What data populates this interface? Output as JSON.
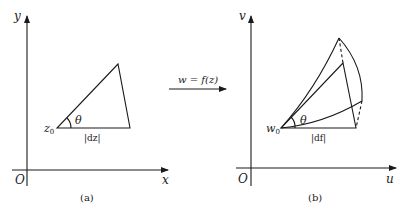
{
  "panel_a": {
    "y_axis_label": "y",
    "x_axis_label": "x",
    "origin_label": "O",
    "point_label": "z",
    "point_subscript": "0",
    "angle_label": "θ",
    "segment_label": "|dz|",
    "caption": "(a)"
  },
  "mapping": {
    "label": "w = f(z)"
  },
  "panel_b": {
    "y_axis_label": "v",
    "x_axis_label": "u",
    "origin_label": "O",
    "point_label": "w",
    "point_subscript": "0",
    "angle_label": "θ",
    "segment_label": "|df|",
    "caption": "(b)"
  },
  "colors": {
    "ink": "#1a1a1a",
    "background": "#ffffff"
  }
}
